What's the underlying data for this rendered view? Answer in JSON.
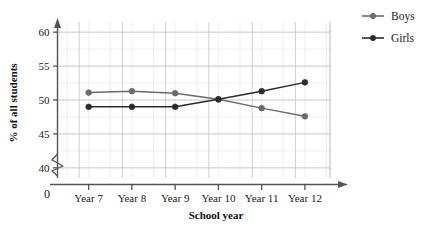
{
  "chart_data": {
    "type": "line",
    "title": "",
    "xlabel": "School year",
    "ylabel": "% of all students",
    "categories": [
      "Year 7",
      "Year 8",
      "Year 9",
      "Year 10",
      "Year 11",
      "Year 12"
    ],
    "series": [
      {
        "name": "Boys",
        "color": "#6b6b6b",
        "values": [
          51.1,
          51.3,
          51.0,
          50.1,
          48.8,
          47.6
        ]
      },
      {
        "name": "Girls",
        "color": "#2b2b2b",
        "values": [
          49.0,
          49.0,
          49.0,
          50.1,
          51.3,
          52.6
        ]
      }
    ],
    "ylim": [
      38.5,
      61.5
    ],
    "yticks": [
      40,
      45,
      50,
      55,
      60
    ],
    "ytick_labels": [
      "40",
      "45",
      "50",
      "55",
      "60"
    ],
    "origin_label": "0",
    "axis_break": true,
    "grid": true,
    "grid_minor": true,
    "legend_position": "right"
  },
  "legend": {
    "items": [
      {
        "label": "Boys"
      },
      {
        "label": "Girls"
      }
    ]
  },
  "axes": {
    "x_title": "School year",
    "y_title": "% of all students",
    "origin": "0"
  },
  "colors": {
    "grid_major": "#c9c9c9",
    "grid_minor": "#ebebeb",
    "axis": "#555555",
    "boys": "#6b6b6b",
    "girls": "#2b2b2b",
    "text": "#1a1a1a",
    "background": "#ffffff"
  }
}
